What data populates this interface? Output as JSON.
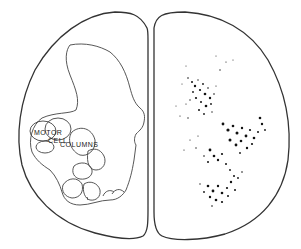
{
  "figure": {
    "type": "spinal-cord-cross-section",
    "labels": {
      "motor": "MOTOR",
      "cell": "CELL",
      "columns": "COLUMNS"
    },
    "colors": {
      "outline": "#333333",
      "stipple": "#111111",
      "background": "#ffffff"
    }
  }
}
